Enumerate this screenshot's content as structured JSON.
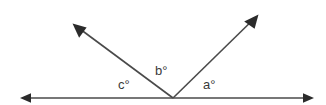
{
  "diagram": {
    "background_color": "#ffffff",
    "stroke_color": "#4a4a4a",
    "text_color": "#3a3a3a",
    "canvas": {
      "width": 326,
      "height": 105
    },
    "vertex": {
      "x": 173,
      "y": 98
    },
    "baseline": {
      "name": "horizontal-double-arrow-line",
      "x1": 20,
      "y1": 98,
      "x2": 314,
      "y2": 98,
      "arrow_start": true,
      "arrow_end": true
    },
    "rays": [
      {
        "name": "ray-upper-left",
        "x1": 173,
        "y1": 98,
        "x2": 73,
        "y2": 24,
        "arrow_end": true
      },
      {
        "name": "ray-upper-right",
        "x1": 173,
        "y1": 98,
        "x2": 258,
        "y2": 15,
        "arrow_end": true
      }
    ],
    "labels": [
      {
        "id": "a",
        "text": "a°",
        "x": 203,
        "y": 78
      },
      {
        "id": "b",
        "text": "b°",
        "x": 155,
        "y": 64
      },
      {
        "id": "c",
        "text": "c°",
        "x": 118,
        "y": 78
      }
    ]
  }
}
